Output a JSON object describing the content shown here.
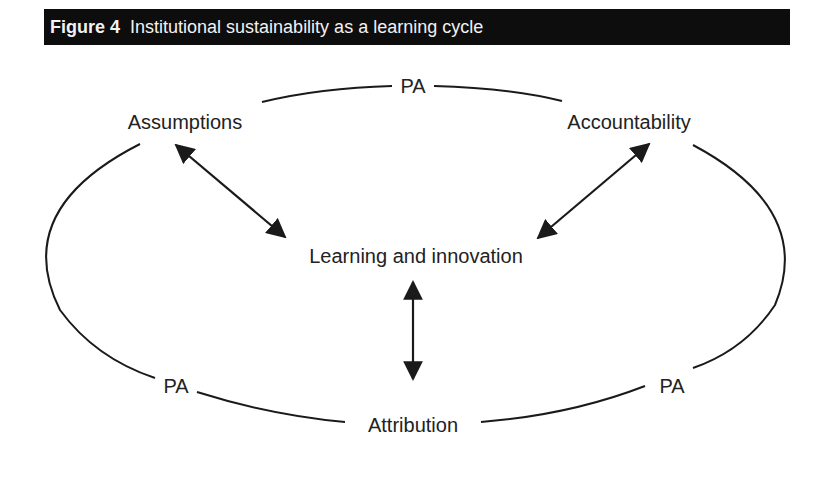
{
  "figure": {
    "number": "Figure 4",
    "title": "Institutional sustainability as a learning cycle"
  },
  "nodes": {
    "assumptions": "Assumptions",
    "accountability": "Accountability",
    "learning": "Learning and innovation",
    "attribution": "Attribution"
  },
  "cycle_labels": {
    "top": "PA",
    "bottom_left": "PA",
    "bottom_right": "PA"
  },
  "edges": [
    {
      "from": "Assumptions",
      "to": "Learning and innovation",
      "type": "bidirectional"
    },
    {
      "from": "Accountability",
      "to": "Learning and innovation",
      "type": "bidirectional"
    },
    {
      "from": "Attribution",
      "to": "Learning and innovation",
      "type": "bidirectional"
    }
  ],
  "colors": {
    "header_bg": "#0d0d0d",
    "header_text": "#f2f2f2",
    "line": "#1a1a1a"
  }
}
